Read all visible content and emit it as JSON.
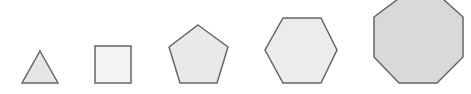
{
  "figure": {
    "stroke_color": "#666666",
    "stroke_width": 1.5,
    "shapes": [
      {
        "name": "triangle",
        "sides": 3,
        "fill": "#e6e6e6",
        "points": "40,51 58,83 22,83"
      },
      {
        "name": "square",
        "sides": 4,
        "fill": "#f3f3f3",
        "points": "95,46 131,46 131,83 95,83"
      },
      {
        "name": "pentagon",
        "sides": 5,
        "fill": "#e9e9e9",
        "points": "198,25 228,47 217,83 180,83 169,47"
      },
      {
        "name": "hexagon",
        "sides": 6,
        "fill": "#ececec",
        "points": "283,18 321,18 337,50 321,83 283,83 265,50"
      },
      {
        "name": "octagon",
        "sides": 8,
        "fill": "#d9d9d9",
        "points": "398,-1 443,-1 463,17 463,57 437,83 399,83 374,57 374,17"
      }
    ]
  }
}
